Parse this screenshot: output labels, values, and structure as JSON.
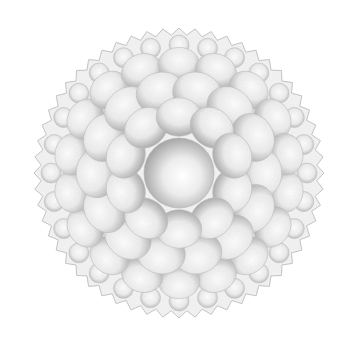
{
  "image": {
    "subject": "grayscale stippled mandala flower",
    "background": "#ffffff",
    "center": [
      179,
      173
    ],
    "outer_radius": 145,
    "core_radius": 35,
    "rings": [
      {
        "radius": 128,
        "count": 28,
        "petal": 14,
        "type": "bead"
      },
      {
        "radius": 108,
        "count": 18,
        "petal": 22,
        "type": "petal"
      },
      {
        "radius": 82,
        "count": 14,
        "petal": 26,
        "type": "petal"
      },
      {
        "radius": 56,
        "count": 10,
        "petal": 24,
        "type": "petal"
      }
    ],
    "colors": {
      "light": "#ffffff",
      "mid": "#d8d8d8",
      "dark": "#9a9a9a"
    }
  }
}
